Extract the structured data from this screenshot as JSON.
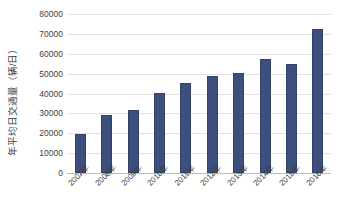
{
  "chart_data": {
    "type": "bar",
    "title": "",
    "xlabel": "",
    "ylabel": "年平均日交通量（辆/日）",
    "categories": [
      "2007年",
      "2008年",
      "2009年",
      "2010年",
      "2011年",
      "2012年",
      "2013年",
      "2014年",
      "2015年",
      "2016年"
    ],
    "values": [
      19800,
      29000,
      31800,
      40100,
      45200,
      48600,
      50400,
      57400,
      55100,
      72400
    ],
    "ylim": [
      0,
      80000
    ],
    "ytick_labels": [
      "80000",
      "70000",
      "60000",
      "50000",
      "40000",
      "30000",
      "20000",
      "10000",
      "0"
    ],
    "ytick_values": [
      80000,
      70000,
      60000,
      50000,
      40000,
      30000,
      20000,
      10000,
      0
    ],
    "grid": true,
    "legend": false,
    "series": [
      {
        "name": "年平均日交通量",
        "color": "#3D4F7C",
        "values": [
          19800,
          29000,
          31800,
          40100,
          45200,
          48600,
          50400,
          57400,
          55100,
          72400
        ]
      }
    ]
  },
  "style": {
    "bar_color": "#3D4F7C",
    "bar_border_color": "#33426A",
    "gridline_color": "#E2E2E2",
    "axis_color": "#BDBDBD",
    "text_color": "#3F3F3F",
    "background": "#FFFFFF"
  }
}
